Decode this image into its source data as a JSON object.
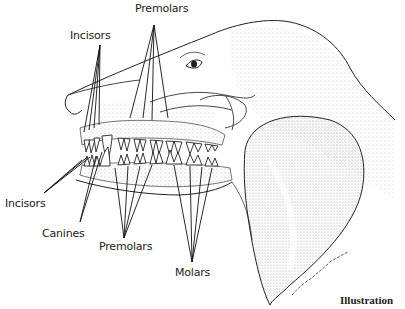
{
  "diagram": {
    "labels": {
      "premolars_top": "Premolars",
      "incisors_top": "Incisors",
      "incisors_bottom": "Incisors",
      "canines": "Canines",
      "premolars_bottom": "Premolars",
      "molars": "Molars"
    },
    "caption": "Illustration",
    "signature": "Nancy Lou Makris"
  }
}
